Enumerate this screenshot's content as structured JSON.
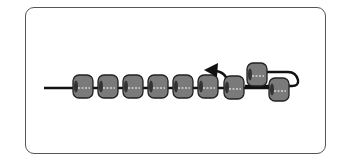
{
  "diagram": {
    "colors": {
      "frame": "#555555",
      "bead_fill": "#7a7a7a",
      "bead_edge": "#222222",
      "thread": "#111111",
      "thread_highlight": "#ffffff"
    },
    "bead_count": 9,
    "beads_on_line": [
      {
        "x": 73,
        "y": 75
      },
      {
        "x": 98,
        "y": 75
      },
      {
        "x": 123,
        "y": 75
      },
      {
        "x": 148,
        "y": 75
      },
      {
        "x": 173,
        "y": 75
      },
      {
        "x": 198,
        "y": 75
      },
      {
        "x": 224,
        "y": 76
      },
      {
        "x": 269,
        "y": 78
      }
    ],
    "raised_bead": {
      "x": 247,
      "y": 63
    },
    "arrow": {
      "direction": "left",
      "label": ""
    }
  }
}
